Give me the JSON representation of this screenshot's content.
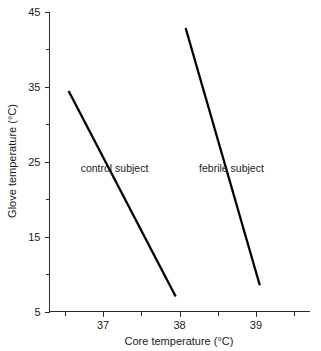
{
  "chart_data": {
    "type": "line",
    "title": "",
    "xlabel": "Core temperature (°C)",
    "ylabel": "Glove temperature (°C)",
    "xlim": [
      36.3,
      39.7
    ],
    "ylim": [
      5,
      45
    ],
    "grid": false,
    "legend_position": "inline-annotation",
    "x_ticks_major": [
      37,
      38,
      39
    ],
    "x_tick_labels": [
      "37",
      "38",
      "39"
    ],
    "x_ticks_minor": [
      36.5,
      37.5,
      38.5,
      39.5
    ],
    "y_ticks_major": [
      5,
      15,
      25,
      35,
      45
    ],
    "y_tick_labels": [
      "5",
      "15",
      "25",
      "35",
      "45"
    ],
    "y_ticks_minor": [
      10,
      20,
      30,
      40
    ],
    "line_color": "#000000",
    "axis_color": "#2b2b2b",
    "series": [
      {
        "name": "control subject",
        "label": "control subject",
        "x": [
          36.55,
          37.95
        ],
        "y": [
          34.4,
          7.0
        ],
        "label_x": 37.15,
        "label_y": 24.2
      },
      {
        "name": "febrile subject",
        "label": "febrile subject",
        "x": [
          38.08,
          39.05
        ],
        "y": [
          42.8,
          8.5
        ],
        "label_x": 38.68,
        "label_y": 24.2
      }
    ],
    "annotations": [
      {
        "text": "control subject",
        "x": 37.15,
        "y": 24.2
      },
      {
        "text": "febrile subject",
        "x": 38.68,
        "y": 24.2
      }
    ]
  }
}
